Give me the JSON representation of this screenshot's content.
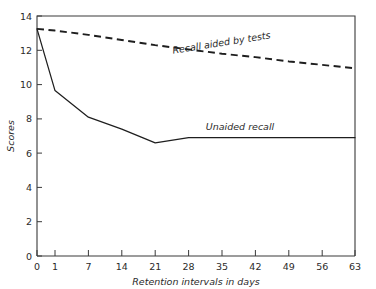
{
  "chart_data": {
    "type": "line",
    "title": "",
    "xlabel": "Retention intervals in days",
    "ylabel": "Scores",
    "x": [
      0,
      1,
      7,
      14,
      21,
      28,
      35,
      42,
      49,
      56,
      63
    ],
    "xticklabels": [
      "0",
      "1",
      "7",
      "14",
      "21",
      "28",
      "35",
      "42",
      "49",
      "56",
      "63"
    ],
    "yticks": [
      0,
      2,
      4,
      6,
      8,
      10,
      12,
      14
    ],
    "yticklabels": [
      "0",
      "2",
      "4",
      "6",
      "8",
      "10",
      "12",
      "14"
    ],
    "xlim": [
      0,
      63
    ],
    "ylim": [
      0,
      14
    ],
    "grid": false,
    "legend_position": "inline-annotation",
    "series": [
      {
        "name": "Recall aided by tests",
        "style": "dashed",
        "label_text": "Recall aided by tests",
        "values": [
          13.25,
          13.15,
          12.9,
          12.6,
          12.3,
          12.05,
          11.8,
          11.6,
          11.35,
          11.15,
          10.95
        ]
      },
      {
        "name": "Unaided recall",
        "style": "solid",
        "label_text": "Unaided recall",
        "values": [
          13.25,
          9.65,
          8.1,
          7.4,
          6.6,
          6.9,
          6.9,
          6.9,
          6.9,
          6.9,
          6.9
        ]
      }
    ],
    "annotations": [
      {
        "text": "Recall aided by tests",
        "x": 35,
        "y": 12.55,
        "rotation": -9
      },
      {
        "text": "Unaided recall",
        "x": 38,
        "y": 7.45,
        "rotation": 0
      }
    ],
    "colors": {
      "axis": "#3a3a3a",
      "series_solid": "#1e1e1e",
      "series_dashed": "#1e1e1e",
      "text": "#2b2b2b",
      "background": "#ffffff"
    }
  }
}
